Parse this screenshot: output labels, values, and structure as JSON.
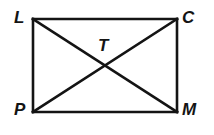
{
  "figure": {
    "kind": "rectangle-with-diagonals",
    "stroke_color": "#141414",
    "background_color": "#ffffff",
    "stroke_width": 2.6,
    "labels": {
      "top_left": "L",
      "top_right": "C",
      "bottom_left": "P",
      "bottom_right": "M",
      "center": "T"
    },
    "vertices": [
      {
        "name": "L",
        "x": 33,
        "y": 19
      },
      {
        "name": "C",
        "x": 177,
        "y": 19
      },
      {
        "name": "M",
        "x": 177,
        "y": 112
      },
      {
        "name": "P",
        "x": 33,
        "y": 112
      }
    ],
    "intersection": {
      "name": "T",
      "x": 105,
      "y": 65.5
    },
    "edges": [
      {
        "from": "L",
        "to": "C"
      },
      {
        "from": "C",
        "to": "M"
      },
      {
        "from": "M",
        "to": "P"
      },
      {
        "from": "P",
        "to": "L"
      }
    ],
    "diagonals": [
      {
        "from": "L",
        "to": "M"
      },
      {
        "from": "C",
        "to": "P"
      }
    ],
    "rect_geometry": {
      "x": 33,
      "y": 19,
      "width": 144,
      "height": 93
    }
  }
}
